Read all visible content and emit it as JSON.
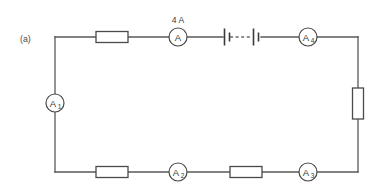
{
  "figure": {
    "panel_label": "(a)",
    "background_color": "#ffffff",
    "line_color": "#58585a",
    "type": "circuit-diagram",
    "topology": "single series loop (rectangle)"
  },
  "annotations": [
    {
      "id": "current-annotation",
      "text": "4 A",
      "attached_to": "ammeter-a"
    }
  ],
  "meters": [
    {
      "id": "ammeter-a",
      "label": "A",
      "subscript": "",
      "position": "top-middle"
    },
    {
      "id": "ammeter-a1",
      "label": "A",
      "subscript": "1",
      "position": "left-middle"
    },
    {
      "id": "ammeter-a2",
      "label": "A",
      "subscript": "2",
      "position": "bottom-left-middle"
    },
    {
      "id": "ammeter-a3",
      "label": "A",
      "subscript": "3",
      "position": "bottom-right"
    },
    {
      "id": "ammeter-a4",
      "label": "A",
      "subscript": "4",
      "position": "top-right"
    }
  ],
  "resistors": [
    {
      "id": "resistor-top-left",
      "orientation": "horizontal",
      "position": "top-left"
    },
    {
      "id": "resistor-bottom-left",
      "orientation": "horizontal",
      "position": "bottom-left"
    },
    {
      "id": "resistor-bottom-right",
      "orientation": "horizontal",
      "position": "bottom-middle-right"
    },
    {
      "id": "resistor-right",
      "orientation": "vertical",
      "position": "right-middle"
    }
  ],
  "battery": {
    "id": "battery-symbol",
    "cells": 2,
    "gap_style": "dashed",
    "position": "top-middle-right"
  }
}
